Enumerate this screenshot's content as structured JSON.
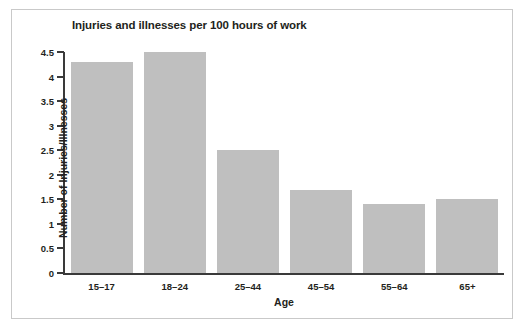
{
  "figure": {
    "border_color": "#c9c9c9",
    "background": "#ffffff"
  },
  "chart_data": {
    "type": "bar",
    "title": "Injuries and illnesses per 100 hours of work",
    "xlabel": "Age",
    "ylabel": "Number of Injuries/Illnesses",
    "categories": [
      "15–17",
      "18–24",
      "25–44",
      "45–54",
      "55–64",
      "65+"
    ],
    "values": [
      4.3,
      4.5,
      2.5,
      1.7,
      1.4,
      1.5
    ],
    "ylim": [
      0,
      4.5
    ],
    "ytick_labels": [
      "0",
      "0.5",
      "1",
      "1.5",
      "2",
      "2.5",
      "3",
      "3.5",
      "4",
      "4.5"
    ],
    "ytick_values": [
      0,
      0.5,
      1,
      1.5,
      2,
      2.5,
      3,
      3.5,
      4,
      4.5
    ],
    "grid": false,
    "legend": null,
    "bar_color": "#bfbfbf",
    "axis_color": "#3a3a3a",
    "text_color": "#231f20"
  }
}
